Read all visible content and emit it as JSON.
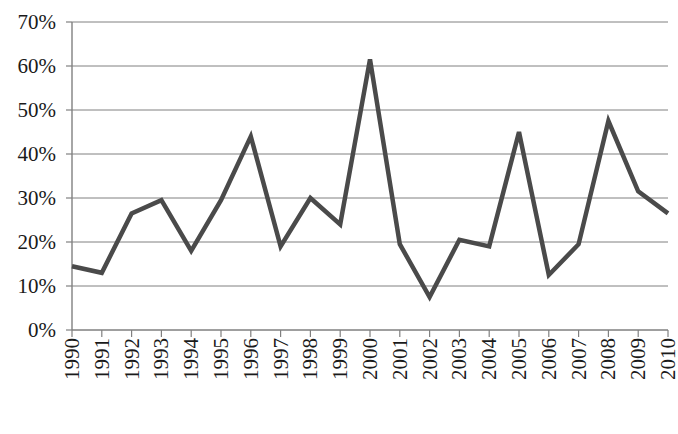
{
  "chart_data": {
    "type": "line",
    "title": "",
    "subtitle": "",
    "xlabel": "",
    "ylabel": "",
    "categories": [
      "1990",
      "1991",
      "1992",
      "1993",
      "1994",
      "1995",
      "1996",
      "1997",
      "1998",
      "1999",
      "2000",
      "2001",
      "2002",
      "2003",
      "2004",
      "2005",
      "2006",
      "2007",
      "2008",
      "2009",
      "2010"
    ],
    "values": [
      14.5,
      13,
      26.5,
      29.5,
      18,
      29.5,
      44,
      19,
      30,
      24,
      61.5,
      19.5,
      7.5,
      20.5,
      19,
      45,
      12.5,
      19.5,
      47.5,
      31.5,
      26.5
    ],
    "value_unit": "%",
    "ylim": [
      0,
      70
    ],
    "ytick_values": [
      0,
      10,
      20,
      30,
      40,
      50,
      60,
      70
    ],
    "ytick_labels": [
      "0%",
      "10%",
      "20%",
      "30%",
      "40%",
      "50%",
      "60%",
      "70%"
    ],
    "xtick_labels": [
      "1990",
      "1991",
      "1992",
      "1993",
      "1994",
      "1995",
      "1996",
      "1997",
      "1998",
      "1999",
      "2000",
      "2001",
      "2002",
      "2003",
      "2004",
      "2005",
      "2006",
      "2007",
      "2008",
      "2009",
      "2010"
    ],
    "xtick_label_rotation": 90,
    "grid": {
      "horizontal": true,
      "vertical": false,
      "color": "#808080"
    },
    "legend": {
      "visible": false,
      "position": "none",
      "entries": []
    },
    "series": [
      {
        "name": "",
        "color": "#4a4a4a",
        "line_width": 4.5,
        "markers": false,
        "values": [
          14.5,
          13,
          26.5,
          29.5,
          18,
          29.5,
          44,
          19,
          30,
          24,
          61.5,
          19.5,
          7.5,
          20.5,
          19,
          45,
          12.5,
          19.5,
          47.5,
          31.5,
          26.5
        ]
      }
    ],
    "axis": {
      "y_axis_line_color": "#808080",
      "x_axis_line_color": "#808080",
      "background": "#ffffff"
    }
  }
}
